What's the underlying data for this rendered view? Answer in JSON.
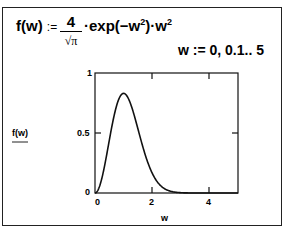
{
  "worksheet": {
    "function_def": {
      "lhs": "f(w)",
      "assign": ":=",
      "numerator": "4",
      "denominator": "√π",
      "rest": "·exp(−w",
      "rest2": ")·w",
      "exp": "2"
    },
    "range_def": "w := 0, 0.1.. 5"
  },
  "chart_data": {
    "type": "line",
    "title": "",
    "xlabel": "w",
    "ylabel": "f(w)",
    "xlim": [
      0,
      5
    ],
    "ylim": [
      0,
      1
    ],
    "x_ticks": [
      "0",
      "2",
      "4"
    ],
    "y_ticks": [
      "0",
      "0.5",
      "1"
    ],
    "grid": false,
    "series": [
      {
        "name": "f(w)",
        "formula": "4/sqrt(pi)*exp(-w^2)*w^2",
        "x": [
          0,
          0.2,
          0.4,
          0.6,
          0.8,
          1.0,
          1.2,
          1.4,
          1.6,
          1.8,
          2.0,
          2.2,
          2.4,
          2.6,
          2.8,
          3.0,
          3.5,
          4.0,
          4.5,
          5.0
        ],
        "values": [
          0,
          0.087,
          0.306,
          0.566,
          0.762,
          0.83,
          0.772,
          0.624,
          0.445,
          0.28,
          0.165,
          0.087,
          0.041,
          0.018,
          0.007,
          0.003,
          0.0001,
          0,
          0,
          0
        ]
      }
    ]
  }
}
